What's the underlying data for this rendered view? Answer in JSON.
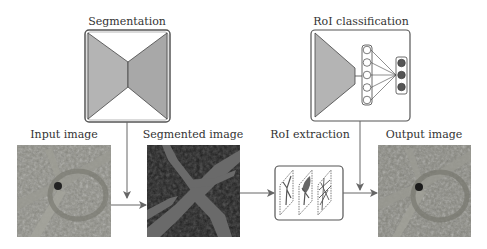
{
  "stages": {
    "segmentation": {
      "title": "Segmentation",
      "net_label": "CNN"
    },
    "roi_classification": {
      "title": "RoI classification",
      "net_label": "CNN",
      "hidden_units": 5,
      "output_units": 3
    },
    "input_image": {
      "title": "Input image"
    },
    "segmented_image": {
      "title": "Segmented image"
    },
    "roi_extraction": {
      "title": "RoI extraction",
      "roi_count": 3
    },
    "output_image": {
      "title": "Output image"
    }
  },
  "colors": {
    "encoder_fill": "#b4b4b4",
    "decoder_fill": "#a8a8a8",
    "box_stroke": "#555555",
    "arrow": "#666666",
    "output_unit_fill": "#555555",
    "segment_fill": "#6a6a6a",
    "segment_bg": "#1e1e1e",
    "aerial_base": "#8a8a82"
  },
  "flow": [
    "input_image -> segmented_image",
    "segmentation -> segmented_image",
    "segmented_image -> roi_extraction",
    "roi_extraction -> output_image",
    "roi_classification -> output_image"
  ]
}
